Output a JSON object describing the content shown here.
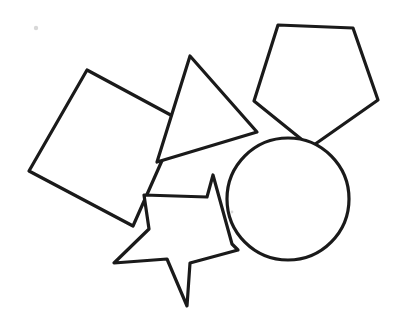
{
  "canvas": {
    "width": 405,
    "height": 327,
    "background_color": "#ffffff",
    "stroke_color": "#1a1a1a",
    "stroke_width": 3.2,
    "title": "Overlapping Geometric Shapes Line Drawing",
    "description": "Hand-drawn black outline drawing of five overlapping geometric shapes on a white background: a tilted square, a triangle, a pentagon, a circle and a five-pointed star."
  },
  "shapes": [
    {
      "id": "square",
      "name": "tilted-square",
      "label": "Square",
      "kind": "polygon",
      "fill": "#ffffff",
      "stroke": "#1a1a1a",
      "points": "87,70 180,120 133,226 29,171",
      "z": 1
    },
    {
      "id": "triangle",
      "name": "triangle",
      "label": "Triangle",
      "kind": "polygon",
      "fill": "#ffffff",
      "stroke": "#1a1a1a",
      "points": "190,56 257,132 157,162",
      "z": 2
    },
    {
      "id": "pentagon",
      "name": "pentagon",
      "label": "Pentagon",
      "kind": "polygon",
      "fill": "#ffffff",
      "stroke": "#1a1a1a",
      "points": "278,25 353,28 378,100 311,147 254,101",
      "z": 3
    },
    {
      "id": "circle",
      "name": "circle",
      "label": "Circle",
      "kind": "circle",
      "fill": "#ffffff",
      "stroke": "#1a1a1a",
      "cx": 288,
      "cy": 199,
      "r": 61,
      "z": 4
    },
    {
      "id": "star",
      "name": "five-pointed-star",
      "label": "Star",
      "kind": "polygon",
      "fill": "#ffffff",
      "stroke": "#1a1a1a",
      "points": "213,175 232,244 238,250 190,263 187,306 167,259 114,263 149,229 144,195 207,197",
      "z": 5
    }
  ],
  "marks": [
    {
      "id": "speck-top-left",
      "name": "paper-speck",
      "cx": 36,
      "cy": 28,
      "r": 2.2,
      "color": "#d8d8d8"
    },
    {
      "id": "speck-circle-edge",
      "name": "stroke-gap-speck",
      "cx": 232,
      "cy": 212,
      "r": 1.4,
      "color": "#e8e8e8"
    }
  ]
}
